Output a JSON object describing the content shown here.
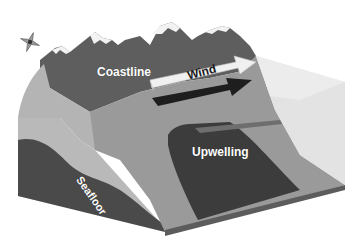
{
  "diagram": {
    "labels": {
      "coastline": "Coastline",
      "wind": "Wind",
      "upwelling": "Upwelling",
      "seafloor": "Seafloor"
    },
    "icons": {
      "compass": "compass-rose-icon",
      "wind_arrow": "wind-arrow",
      "current_arrow": "surface-current-arrow"
    },
    "colors": {
      "background": "#ffffff",
      "mountain": "#5e5e5e",
      "snow": "#f2f2f2",
      "land_dark": "#4a4a4a",
      "shelf": "#9a9a9a",
      "water_face": "#d9d9d9",
      "upwelling": "#3c3c3c",
      "current_arrow": "#1e1e1e"
    }
  }
}
